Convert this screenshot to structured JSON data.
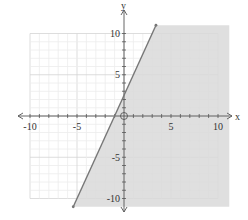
{
  "chart_data": {
    "type": "area",
    "title": "",
    "xlabel": "x",
    "ylabel": "y",
    "xlim": [
      -11,
      11
    ],
    "ylim": [
      -11,
      11
    ],
    "grid": true,
    "minor_grid_step": 1,
    "major_grid_step": 5,
    "x_ticks": [
      -10,
      -5,
      5,
      10
    ],
    "y_ticks": [
      -10,
      -5,
      5,
      10
    ],
    "x_tick_labels": [
      "-10",
      "-5",
      "5",
      "10"
    ],
    "y_tick_labels": [
      "-10",
      "-5",
      "5",
      "10"
    ],
    "series": [
      {
        "name": "boundary line",
        "kind": "line",
        "style": "solid",
        "slope": 2.5,
        "intercept": 2.5,
        "points": [
          [
            -5.4,
            -11
          ],
          [
            3.4,
            11
          ]
        ]
      },
      {
        "name": "shaded region",
        "kind": "region",
        "inequality": "y <= 2.5x + 2.5",
        "side": "right/below line"
      }
    ],
    "origin_marker": "open circle at (0,0)"
  },
  "axes": {
    "x_label": "x",
    "y_label": "y"
  },
  "colors": {
    "shade": "#d9d9d9",
    "line": "#777777",
    "grid_minor": "#ececec",
    "grid_major": "#d4d4d4",
    "axis": "#555555"
  }
}
